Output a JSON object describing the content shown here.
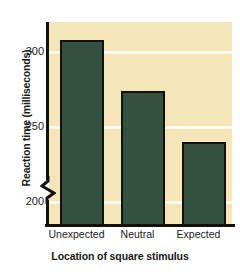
{
  "chart_data": {
    "type": "bar",
    "title": "",
    "categories": [
      "Unexpected",
      "Neutral",
      "Expected"
    ],
    "values": [
      308,
      274,
      240
    ],
    "xlabel": "Location of square stimulus",
    "ylabel": "Reaction time (milliseconds)",
    "yticks": [
      300,
      250,
      200
    ],
    "ytick_labels": [
      "300",
      "250",
      "200"
    ],
    "ylim": [
      185,
      320
    ],
    "y_axis_break": true,
    "grid": "horizontal",
    "legend": "none",
    "colors": {
      "bar_fill": "#33523f",
      "bar_outline": "#14100e",
      "plot_background": "#f4e6b8",
      "gridline": "#fdfbf0",
      "axis": "#14100e",
      "text": "#1a1a1a",
      "page_background": "#ffffff"
    }
  }
}
